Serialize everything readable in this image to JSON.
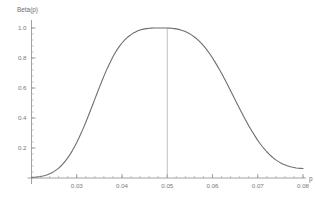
{
  "chart_data": {
    "type": "line",
    "title": "",
    "subtitle": "",
    "xlabel": "p",
    "ylabel": "Beta(p)",
    "xlim": [
      0.02,
      0.08
    ],
    "ylim": [
      0.0,
      1.05
    ],
    "grid": false,
    "legend": false,
    "legend_position": "none",
    "curve_color": "#6e6e6e",
    "reference_line_color": "#b0b0b0",
    "axis_color": "#8c8c8c",
    "background_color": "#ffffff",
    "x_ticks": [
      {
        "value": 0.03,
        "label": "0.03"
      },
      {
        "value": 0.04,
        "label": "0.04"
      },
      {
        "value": 0.05,
        "label": "0.05"
      },
      {
        "value": 0.06,
        "label": "0.06"
      },
      {
        "value": 0.07,
        "label": "0.07"
      },
      {
        "value": 0.08,
        "label": "0.08"
      }
    ],
    "y_ticks": [
      {
        "value": 0.2,
        "label": "0.2"
      },
      {
        "value": 0.4,
        "label": "0.4"
      },
      {
        "value": 0.6,
        "label": "0.6"
      },
      {
        "value": 0.8,
        "label": "0.8"
      },
      {
        "value": 1.0,
        "label": "1.0"
      }
    ],
    "x_minor_tick_step": 0.002,
    "y_minor_tick_step": 0.04,
    "reference_line": {
      "x": 0.05,
      "y_top": 1.0,
      "y_bottom": 0.0,
      "orientation": "vertical"
    },
    "peak": {
      "x": 0.05,
      "y": 1.0
    },
    "series": [
      {
        "name": "Beta(p)",
        "x": [
          0.02,
          0.0205,
          0.021,
          0.0215,
          0.022,
          0.0225,
          0.023,
          0.0235,
          0.024,
          0.0245,
          0.025,
          0.0255,
          0.026,
          0.0265,
          0.027,
          0.0275,
          0.028,
          0.0285,
          0.029,
          0.0295,
          0.03,
          0.0305,
          0.031,
          0.0315,
          0.032,
          0.0325,
          0.033,
          0.0335,
          0.034,
          0.0345,
          0.035,
          0.0355,
          0.036,
          0.0365,
          0.037,
          0.0375,
          0.038,
          0.0385,
          0.039,
          0.0395,
          0.04,
          0.0405,
          0.041,
          0.0415,
          0.042,
          0.0425,
          0.043,
          0.0435,
          0.044,
          0.0445,
          0.045,
          0.0455,
          0.046,
          0.0465,
          0.047,
          0.0475,
          0.048,
          0.0485,
          0.049,
          0.0495,
          0.05,
          0.0505,
          0.051,
          0.0515,
          0.052,
          0.0525,
          0.053,
          0.0535,
          0.054,
          0.0545,
          0.055,
          0.0555,
          0.056,
          0.0565,
          0.057,
          0.0575,
          0.058,
          0.0585,
          0.059,
          0.0595,
          0.06,
          0.0605,
          0.061,
          0.0615,
          0.062,
          0.0625,
          0.063,
          0.0635,
          0.064,
          0.0645,
          0.065,
          0.0655,
          0.066,
          0.0665,
          0.067,
          0.0675,
          0.068,
          0.0685,
          0.069,
          0.0695,
          0.07,
          0.0705,
          0.071,
          0.0715,
          0.072,
          0.0725,
          0.073,
          0.0735,
          0.074,
          0.0745,
          0.075,
          0.0755,
          0.076,
          0.0765,
          0.077,
          0.0775,
          0.078,
          0.0785,
          0.079,
          0.0795,
          0.08
        ],
        "values": [
          0.004,
          0.005,
          0.006,
          0.008,
          0.01,
          0.013,
          0.017,
          0.022,
          0.028,
          0.035,
          0.044,
          0.054,
          0.066,
          0.08,
          0.096,
          0.114,
          0.134,
          0.156,
          0.181,
          0.208,
          0.237,
          0.268,
          0.301,
          0.336,
          0.372,
          0.41,
          0.448,
          0.487,
          0.526,
          0.565,
          0.604,
          0.642,
          0.679,
          0.714,
          0.747,
          0.779,
          0.808,
          0.835,
          0.859,
          0.881,
          0.9,
          0.917,
          0.932,
          0.945,
          0.956,
          0.966,
          0.974,
          0.981,
          0.987,
          0.991,
          0.994,
          0.996,
          0.998,
          0.999,
          1.0,
          1.0,
          1.0,
          1.0,
          1.0,
          1.0,
          1.0,
          0.999,
          0.998,
          0.996,
          0.994,
          0.991,
          0.987,
          0.982,
          0.976,
          0.969,
          0.961,
          0.951,
          0.94,
          0.928,
          0.914,
          0.899,
          0.882,
          0.864,
          0.844,
          0.823,
          0.8,
          0.776,
          0.751,
          0.725,
          0.698,
          0.67,
          0.641,
          0.612,
          0.582,
          0.552,
          0.522,
          0.492,
          0.462,
          0.433,
          0.404,
          0.376,
          0.349,
          0.323,
          0.298,
          0.274,
          0.251,
          0.23,
          0.21,
          0.192,
          0.175,
          0.159,
          0.145,
          0.132,
          0.121,
          0.111,
          0.102,
          0.094,
          0.088,
          0.082,
          0.077,
          0.073,
          0.07,
          0.067,
          0.065,
          0.064,
          0.063
        ]
      }
    ]
  }
}
